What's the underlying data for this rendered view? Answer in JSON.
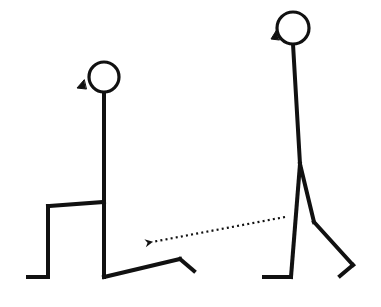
{
  "diagram": {
    "description": "Stick figure illustration of a lunge exercise: a standing figure on the right steps back into a lunge position shown on the left, with a dotted arrow indicating the backward motion.",
    "stroke_color": "#111111",
    "background_color": "#ffffff",
    "figures": [
      {
        "id": "lunge-figure",
        "pose": "lunge",
        "head": {
          "cx": 104,
          "cy": 77,
          "r": 15
        },
        "beak": [
          [
            84,
            80
          ],
          [
            77,
            88
          ],
          [
            86,
            89
          ]
        ],
        "segments": [
          {
            "name": "torso",
            "points": [
              [
                104,
                92
              ],
              [
                104,
                277
              ]
            ]
          },
          {
            "name": "front-thigh",
            "points": [
              [
                104,
                202
              ],
              [
                48,
                206
              ]
            ]
          },
          {
            "name": "front-shin",
            "points": [
              [
                48,
                206
              ],
              [
                48,
                277
              ]
            ]
          },
          {
            "name": "front-foot",
            "points": [
              [
                48,
                277
              ],
              [
                28,
                277
              ]
            ]
          },
          {
            "name": "back-leg",
            "points": [
              [
                104,
                277
              ],
              [
                180,
                259
              ]
            ]
          },
          {
            "name": "back-foot",
            "points": [
              [
                180,
                259
              ],
              [
                194,
                271
              ]
            ]
          }
        ]
      },
      {
        "id": "standing-figure",
        "pose": "standing-step",
        "head": {
          "cx": 293,
          "cy": 28,
          "r": 16
        },
        "beak": [
          [
            276,
            31
          ],
          [
            271,
            39
          ],
          [
            279,
            40
          ]
        ],
        "segments": [
          {
            "name": "torso",
            "points": [
              [
                293,
                44
              ],
              [
                300,
                164
              ]
            ]
          },
          {
            "name": "front-leg",
            "points": [
              [
                300,
                164
              ],
              [
                291,
                277
              ]
            ]
          },
          {
            "name": "front-foot",
            "points": [
              [
                291,
                277
              ],
              [
                264,
                277
              ]
            ]
          },
          {
            "name": "back-thigh",
            "points": [
              [
                300,
                164
              ],
              [
                314,
                222
              ]
            ]
          },
          {
            "name": "back-shin",
            "points": [
              [
                314,
                222
              ],
              [
                353,
                265
              ]
            ]
          },
          {
            "name": "back-foot",
            "points": [
              [
                353,
                265
              ],
              [
                340,
                276
              ]
            ]
          }
        ]
      }
    ],
    "arrow": {
      "style": "dotted",
      "from": [
        285,
        217
      ],
      "to": [
        152,
        242
      ],
      "head_tip": [
        145,
        243
      ],
      "meaning": "step backward into lunge"
    }
  }
}
